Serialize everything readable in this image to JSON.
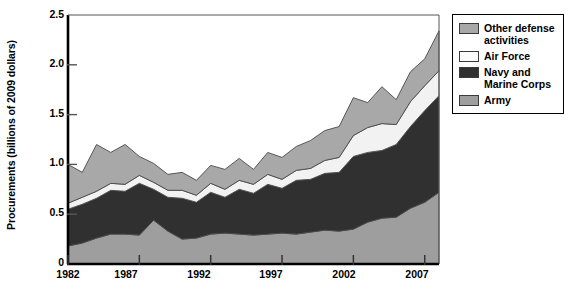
{
  "chart_data": {
    "type": "area",
    "stacked": true,
    "title": "",
    "subtitle": "",
    "xlabel": "",
    "ylabel": "Procurements (billions of 2009 dollars)",
    "xlim": [
      1982,
      2008
    ],
    "ylim": [
      0,
      2.5
    ],
    "grid": false,
    "legend_position": "right-outside",
    "y_ticks": [
      "0",
      "0.5",
      "1.0",
      "1.5",
      "2.0",
      "2.5"
    ],
    "y_tick_values": [
      0,
      0.5,
      1.0,
      1.5,
      2.0,
      2.5
    ],
    "x_ticks": [
      "1982",
      "1987",
      "1992",
      "1997",
      "2002",
      "2007"
    ],
    "x_tick_values": [
      1982,
      1987,
      1992,
      1997,
      2002,
      2007
    ],
    "x": [
      1982,
      1983,
      1984,
      1985,
      1986,
      1987,
      1988,
      1989,
      1990,
      1991,
      1992,
      1993,
      1994,
      1995,
      1996,
      1997,
      1998,
      1999,
      2000,
      2001,
      2002,
      2003,
      2004,
      2005,
      2006,
      2007,
      2008
    ],
    "series": [
      {
        "name": "Army",
        "color": "#9e9e9e",
        "values": [
          0.18,
          0.21,
          0.26,
          0.3,
          0.3,
          0.29,
          0.44,
          0.33,
          0.25,
          0.26,
          0.3,
          0.31,
          0.3,
          0.29,
          0.3,
          0.31,
          0.3,
          0.32,
          0.34,
          0.33,
          0.35,
          0.42,
          0.46,
          0.47,
          0.56,
          0.62,
          0.72
        ]
      },
      {
        "name": "Navy and Marine Corps",
        "color": "#303030",
        "values": [
          0.37,
          0.39,
          0.4,
          0.44,
          0.43,
          0.52,
          0.31,
          0.34,
          0.41,
          0.36,
          0.42,
          0.36,
          0.45,
          0.42,
          0.5,
          0.45,
          0.54,
          0.53,
          0.57,
          0.59,
          0.73,
          0.7,
          0.68,
          0.73,
          0.82,
          0.92,
          0.97
        ]
      },
      {
        "name": "Air Force",
        "color": "#f2f2f2",
        "values": [
          0.06,
          0.07,
          0.07,
          0.07,
          0.07,
          0.08,
          0.07,
          0.07,
          0.08,
          0.07,
          0.09,
          0.08,
          0.09,
          0.09,
          0.1,
          0.09,
          0.1,
          0.11,
          0.13,
          0.15,
          0.21,
          0.25,
          0.27,
          0.2,
          0.25,
          0.25,
          0.25
        ]
      },
      {
        "name": "Other defense activities",
        "color": "#a8a8a8",
        "values": [
          0.39,
          0.25,
          0.47,
          0.31,
          0.4,
          0.19,
          0.19,
          0.16,
          0.18,
          0.15,
          0.18,
          0.2,
          0.22,
          0.15,
          0.22,
          0.22,
          0.24,
          0.28,
          0.3,
          0.31,
          0.38,
          0.25,
          0.37,
          0.25,
          0.3,
          0.27,
          0.4
        ]
      }
    ]
  },
  "legend": {
    "items": [
      {
        "label": "Other defense\nactivities",
        "color": "#a8a8a8"
      },
      {
        "label": "Air Force",
        "color": "#fbfbfb"
      },
      {
        "label": "Navy and\nMarine Corps",
        "color": "#303030"
      },
      {
        "label": "Army",
        "color": "#9e9e9e"
      }
    ]
  },
  "axes": {
    "ylabel": "Procurements (billions of 2009 dollars)",
    "y_ticks": [
      "2.5",
      "2.0",
      "1.5",
      "1.0",
      "0.5",
      "0"
    ],
    "x_ticks": [
      "1982",
      "1987",
      "1992",
      "1997",
      "2002",
      "2007"
    ]
  }
}
